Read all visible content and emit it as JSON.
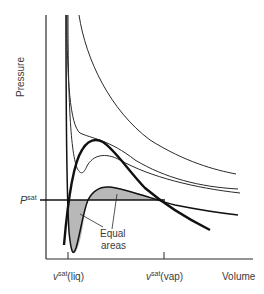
{
  "diagram": {
    "title": "",
    "axes": {
      "y_label": "Pressure",
      "x_label": "Volume",
      "x_ticks": [
        {
          "base": "v",
          "sup": "sat",
          "suffix": "(liq)"
        },
        {
          "base": "v",
          "sup": "sat",
          "suffix": "(vap)"
        }
      ],
      "y_marker": {
        "base": "P",
        "sup": "sat"
      }
    },
    "annotation": {
      "line1": "Equal",
      "line2": "areas"
    },
    "colors": {
      "line": "#2a2a2a",
      "thick_line": "#111111",
      "shade": "#b8b8b8",
      "text": "#3a3a3a"
    }
  }
}
